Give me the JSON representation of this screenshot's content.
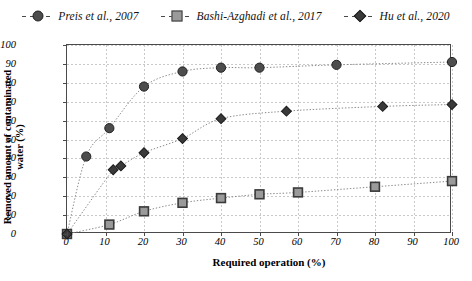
{
  "legend": {
    "items": [
      {
        "label": "Preis et al., 2007",
        "marker": "circle-marker",
        "color": "#4d4d4d"
      },
      {
        "label": "Bashi-Azghadi et al., 2017",
        "marker": "square-marker",
        "color": "#9a9a9a"
      },
      {
        "label": "Hu et al., 2020",
        "marker": "diamond-marker",
        "color": "#3a3a3a"
      }
    ]
  },
  "axes": {
    "ylabel": "Removed amount of contaminated water (%)",
    "xlabel": "Required operation (%)",
    "yticks": [
      "100",
      "90",
      "80",
      "70",
      "60",
      "50",
      "40",
      "30",
      "20",
      "10",
      "0"
    ],
    "xticks": [
      "0",
      "10",
      "20",
      "30",
      "40",
      "50",
      "60",
      "70",
      "80",
      "90",
      "100"
    ]
  },
  "chart_data": {
    "type": "line",
    "title": "",
    "xlabel": "Required operation (%)",
    "ylabel": "Removed amount of contaminated water (%)",
    "xlim": [
      0,
      100
    ],
    "ylim": [
      0,
      100
    ],
    "xtick_step": 10,
    "ytick_step": 10,
    "grid": true,
    "legend_position": "top",
    "series": [
      {
        "name": "Preis et al., 2007",
        "marker": "circle",
        "color": "#4d4d4d",
        "points": [
          {
            "x": 0,
            "y": 0
          },
          {
            "x": 5,
            "y": 41
          },
          {
            "x": 11,
            "y": 56
          },
          {
            "x": 20,
            "y": 78
          },
          {
            "x": 30,
            "y": 86
          },
          {
            "x": 40,
            "y": 88
          },
          {
            "x": 50,
            "y": 88
          },
          {
            "x": 70,
            "y": 89.5
          },
          {
            "x": 100,
            "y": 91
          }
        ]
      },
      {
        "name": "Bashi-Azghadi et al., 2017",
        "marker": "square",
        "color": "#9a9a9a",
        "points": [
          {
            "x": 0,
            "y": 0
          },
          {
            "x": 11,
            "y": 5
          },
          {
            "x": 20,
            "y": 12
          },
          {
            "x": 30,
            "y": 16.5
          },
          {
            "x": 40,
            "y": 19
          },
          {
            "x": 50,
            "y": 21
          },
          {
            "x": 60,
            "y": 22
          },
          {
            "x": 80,
            "y": 25
          },
          {
            "x": 100,
            "y": 28
          }
        ]
      },
      {
        "name": "Hu et al., 2020",
        "marker": "diamond",
        "color": "#3a3a3a",
        "points": [
          {
            "x": 0,
            "y": 0
          },
          {
            "x": 12,
            "y": 34
          },
          {
            "x": 14,
            "y": 36
          },
          {
            "x": 20,
            "y": 43
          },
          {
            "x": 30,
            "y": 50.5
          },
          {
            "x": 40,
            "y": 61
          },
          {
            "x": 57,
            "y": 65
          },
          {
            "x": 82,
            "y": 67.5
          },
          {
            "x": 100,
            "y": 68.5
          }
        ]
      }
    ]
  }
}
